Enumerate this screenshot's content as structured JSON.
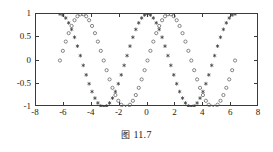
{
  "caption": {
    "prefix": "图",
    "number": "11.7",
    "full": "图 11.7"
  },
  "chart_data": {
    "type": "line",
    "title": "",
    "xlabel": "",
    "ylabel": "",
    "xlim": [
      -8,
      8
    ],
    "ylim": [
      -1,
      1
    ],
    "grid": false,
    "legend": "none",
    "xticks": [
      "-8",
      "-6",
      "-4",
      "-2",
      "0",
      "2",
      "4",
      "6",
      "8"
    ],
    "xtick_values": [
      -8,
      -6,
      -4,
      -2,
      0,
      2,
      4,
      6,
      8
    ],
    "yticks": [
      "-1",
      "-0.5",
      "0",
      "0.5",
      "1"
    ],
    "ytick_values": [
      -1,
      -0.5,
      0,
      0.5,
      1
    ],
    "x_domain": [
      -6.283185,
      6.283185
    ],
    "n_points": 61,
    "series": [
      {
        "name": "cos(x)",
        "marker": "star",
        "color": "#333333",
        "formula": "cos",
        "phase": 0.0,
        "x": [
          -6.2832,
          -6.0737,
          -5.8643,
          -5.6549,
          -5.4454,
          -5.236,
          -5.0265,
          -4.8171,
          -4.6077,
          -4.3982,
          -4.1888,
          -3.9794,
          -3.7699,
          -3.5605,
          -3.351,
          -3.1416,
          -2.9322,
          -2.7227,
          -2.5133,
          -2.3038,
          -2.0944,
          -1.885,
          -1.6755,
          -1.4661,
          -1.2566,
          -1.0472,
          -0.8378,
          -0.6283,
          -0.4189,
          -0.2094,
          0.0,
          0.2094,
          0.4189,
          0.6283,
          0.8378,
          1.0472,
          1.2566,
          1.4661,
          1.6755,
          1.885,
          2.0944,
          2.3038,
          2.5133,
          2.7227,
          2.9322,
          3.1416,
          3.351,
          3.5605,
          3.7699,
          3.9794,
          4.1888,
          4.3982,
          4.6077,
          4.8171,
          5.0265,
          5.236,
          5.4454,
          5.6549,
          5.8643,
          6.0737,
          6.2832
        ],
        "y": [
          1.0,
          0.9781,
          0.9135,
          0.809,
          0.6691,
          0.5,
          0.309,
          0.1045,
          -0.1045,
          -0.309,
          -0.5,
          -0.6691,
          -0.809,
          -0.9135,
          -0.9781,
          -1.0,
          -0.9781,
          -0.9135,
          -0.809,
          -0.6691,
          -0.5,
          -0.309,
          -0.1045,
          0.1045,
          0.309,
          0.5,
          0.6691,
          0.809,
          0.9135,
          0.9781,
          1.0,
          0.9781,
          0.9135,
          0.809,
          0.6691,
          0.5,
          0.309,
          0.1045,
          -0.1045,
          -0.309,
          -0.5,
          -0.6691,
          -0.809,
          -0.9135,
          -0.9781,
          -1.0,
          -0.9781,
          -0.9135,
          -0.809,
          -0.6691,
          -0.5,
          -0.309,
          -0.1045,
          0.1045,
          0.309,
          0.5,
          0.6691,
          0.809,
          0.9135,
          0.9781,
          1.0
        ]
      },
      {
        "name": "sin(x)",
        "marker": "circle",
        "color": "#555555",
        "formula": "sin",
        "phase": 0.0,
        "x": [
          -6.2832,
          -6.0737,
          -5.8643,
          -5.6549,
          -5.4454,
          -5.236,
          -5.0265,
          -4.8171,
          -4.6077,
          -4.3982,
          -4.1888,
          -3.9794,
          -3.7699,
          -3.5605,
          -3.351,
          -3.1416,
          -2.9322,
          -2.7227,
          -2.5133,
          -2.3038,
          -2.0944,
          -1.885,
          -1.6755,
          -1.4661,
          -1.2566,
          -1.0472,
          -0.8378,
          -0.6283,
          -0.4189,
          -0.2094,
          0.0,
          0.2094,
          0.4189,
          0.6283,
          0.8378,
          1.0472,
          1.2566,
          1.4661,
          1.6755,
          1.885,
          2.0944,
          2.3038,
          2.5133,
          2.7227,
          2.9322,
          3.1416,
          3.351,
          3.5605,
          3.7699,
          3.9794,
          4.1888,
          4.3982,
          4.6077,
          4.8171,
          5.0265,
          5.236,
          5.4454,
          5.6549,
          5.8643,
          6.0737,
          6.2832
        ],
        "y": [
          0.0,
          0.2079,
          0.4067,
          0.5878,
          0.7431,
          0.866,
          0.9511,
          0.9945,
          0.9945,
          0.9511,
          0.866,
          0.7431,
          0.5878,
          0.4067,
          0.2079,
          0.0,
          -0.2079,
          -0.4067,
          -0.5878,
          -0.7431,
          -0.866,
          -0.9511,
          -0.9945,
          -0.9945,
          -0.9511,
          -0.866,
          -0.7431,
          -0.5878,
          -0.4067,
          -0.2079,
          0.0,
          0.2079,
          0.4067,
          0.5878,
          0.7431,
          0.866,
          0.9511,
          0.9945,
          0.9945,
          0.9511,
          0.866,
          0.7431,
          0.5878,
          0.4067,
          0.2079,
          0.0,
          -0.2079,
          -0.4067,
          -0.5878,
          -0.7431,
          -0.866,
          -0.9511,
          -0.9945,
          -0.9945,
          -0.9511,
          -0.866,
          -0.7431,
          -0.5878,
          -0.4067,
          -0.2079,
          0.0
        ]
      }
    ]
  }
}
